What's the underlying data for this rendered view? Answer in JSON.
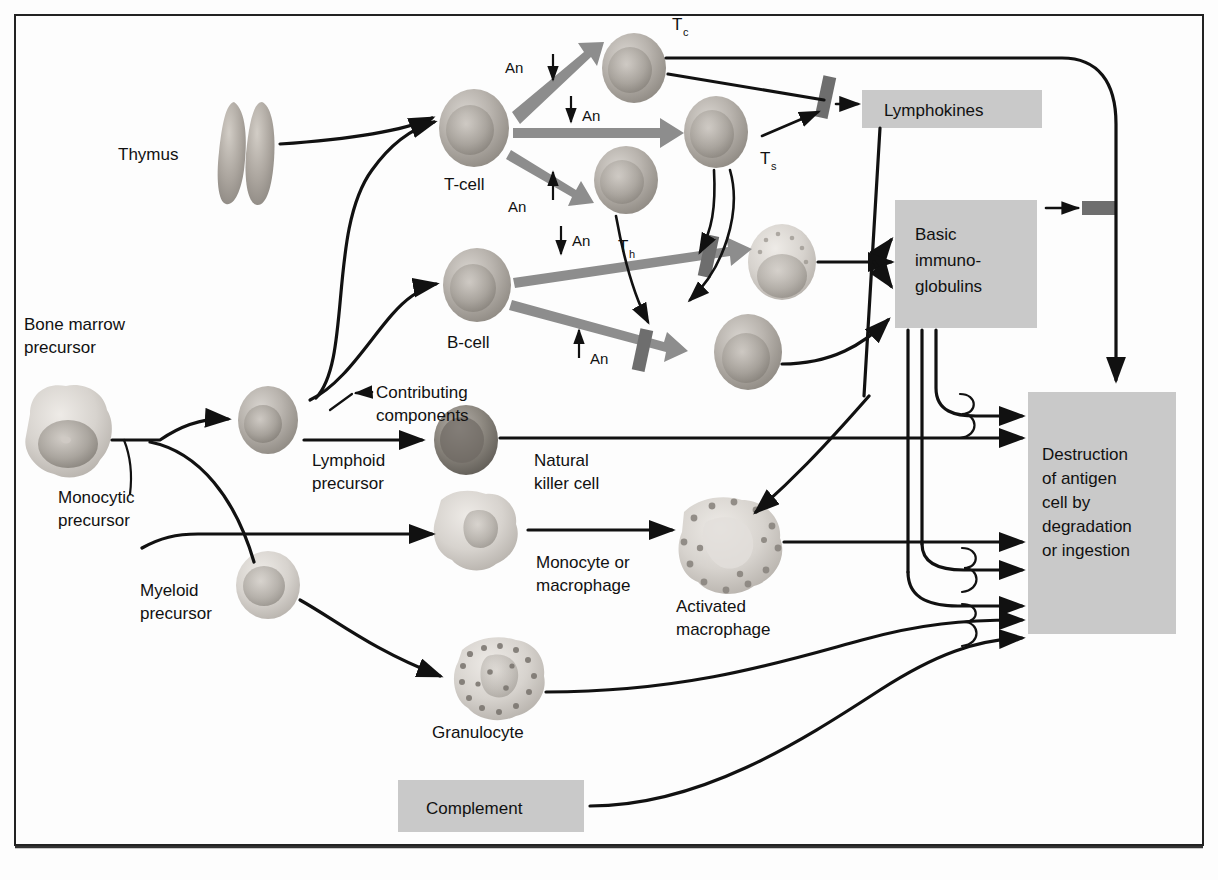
{
  "figure": {
    "domain": "biology-immunology-flow-diagram",
    "frame": {
      "x": 14,
      "y": 14,
      "width": 1190,
      "height": 832
    }
  },
  "colors": {
    "background": "#fdfdfd",
    "box_fill": "#c9c9c9",
    "fat_arrow": "#8d8d8d",
    "gate_bar": "#6e6e6e",
    "line": "#111111",
    "frame": "#222222"
  },
  "labels": {
    "thymus": "Thymus",
    "bone_marrow_precursor": "Bone marrow\nprecursor",
    "bone_marrow_precursor_line1": "Bone marrow",
    "bone_marrow_precursor_line2": "precursor",
    "monocytic_precursor_line1": "Monocytic",
    "monocytic_precursor_line2": "precursor",
    "myeloid_precursor_line1": "Myeloid",
    "myeloid_precursor_line2": "precursor",
    "lymphoid_precursor_line1": "Lymphoid",
    "lymphoid_precursor_line2": "precursor",
    "natural_killer_line1": "Natural",
    "natural_killer_line2": "killer cell",
    "monocyte_macrophage_line1": "Monocyte or",
    "monocyte_macrophage_line2": "macrophage",
    "activated_macrophage_line1": "Activated",
    "activated_macrophage_line2": "macrophage",
    "granulocyte": "Granulocyte",
    "t_cell": "T-cell",
    "b_cell": "B-cell",
    "contributing_components_line1": "Contributing",
    "contributing_components_line2": "components",
    "antigen_abbrev": "An",
    "t_cytotoxic_base": "T",
    "t_cytotoxic_sub": "c",
    "t_suppressor_base": "T",
    "t_suppressor_sub": "s",
    "t_helper_base": "T",
    "t_helper_sub": "h"
  },
  "boxes": [
    {
      "name": "lymphokines",
      "text": "Lymphokines",
      "lines": [
        "Lymphokines"
      ],
      "x": 862,
      "y": 90,
      "width": 180,
      "height": 38,
      "text_x": 884,
      "text_y": 116,
      "align": "left"
    },
    {
      "name": "basic-immunoglobulins",
      "text": "Basic immuno-globulins",
      "lines": [
        "Basic",
        "immuno-",
        "globulins"
      ],
      "x": 895,
      "y": 200,
      "width": 142,
      "height": 128,
      "text_x": 915,
      "text_y": 238,
      "align": "left"
    },
    {
      "name": "destruction-of-antigen",
      "text": "Destruction of antigen cell by degradation or ingestion",
      "lines": [
        "Destruction",
        "of antigen",
        "cell by",
        "degradation",
        "or ingestion"
      ],
      "x": 1028,
      "y": 392,
      "width": 148,
      "height": 242,
      "text_x": 1042,
      "text_y": 452,
      "align": "left"
    },
    {
      "name": "complement",
      "text": "Complement",
      "lines": [
        "Complement"
      ],
      "x": 398,
      "y": 780,
      "width": 186,
      "height": 52,
      "text_x": 426,
      "text_y": 812,
      "align": "left"
    }
  ],
  "antigen_markers": [
    {
      "name": "an-tcell-upper",
      "label": "An",
      "text_x": 505,
      "text_y": 73,
      "arrow_x": 553,
      "arrow_y1": 56,
      "arrow_y2": 82,
      "direction": "down"
    },
    {
      "name": "an-tcell-mid",
      "label": "An",
      "text_x": 590,
      "text_y": 121,
      "arrow_x": 571,
      "arrow_y1": 98,
      "arrow_y2": 124,
      "direction": "down"
    },
    {
      "name": "an-tcell-lower",
      "label": "An",
      "text_x": 508,
      "text_y": 200,
      "arrow_x": 553,
      "arrow_y1": 198,
      "arrow_y2": 168,
      "direction": "up"
    },
    {
      "name": "an-bcell-upper",
      "label": "An",
      "text_x": 580,
      "text_y": 246,
      "arrow_x": 561,
      "arrow_y1": 228,
      "arrow_y2": 256,
      "direction": "down"
    },
    {
      "name": "an-bcell-lower",
      "label": "An",
      "text_x": 598,
      "text_y": 356,
      "arrow_x": 579,
      "arrow_y1": 356,
      "arrow_y2": 328,
      "direction": "up"
    }
  ],
  "cells": [
    {
      "name": "cell-thymus",
      "kind": "thymus",
      "cx": 242,
      "cy": 152,
      "rx": 22,
      "ry": 52
    },
    {
      "name": "cell-bone-marrow-precursor",
      "kind": "blob",
      "cx": 62,
      "cy": 432,
      "rx": 45,
      "ry": 42
    },
    {
      "name": "cell-monocytic-lymphoid-precursor",
      "kind": "round",
      "cx": 268,
      "cy": 420,
      "rx": 30,
      "ry": 34
    },
    {
      "name": "cell-myeloid-precursor",
      "kind": "round-pale",
      "cx": 268,
      "cy": 585,
      "rx": 32,
      "ry": 34
    },
    {
      "name": "cell-natural-killer",
      "kind": "round-dark",
      "cx": 466,
      "cy": 440,
      "rx": 32,
      "ry": 35
    },
    {
      "name": "cell-monocyte-macrophage",
      "kind": "blob",
      "cx": 477,
      "cy": 530,
      "rx": 40,
      "ry": 38
    },
    {
      "name": "cell-granulocyte",
      "kind": "granular",
      "cx": 500,
      "cy": 678,
      "rx": 44,
      "ry": 40
    },
    {
      "name": "cell-activated-macrophage",
      "kind": "granular-big",
      "cx": 726,
      "cy": 545,
      "rx": 48,
      "ry": 45
    },
    {
      "name": "cell-t-cell",
      "kind": "round",
      "cx": 474,
      "cy": 128,
      "rx": 35,
      "ry": 39
    },
    {
      "name": "cell-t-cytotoxic",
      "kind": "round",
      "cx": 634,
      "cy": 68,
      "rx": 32,
      "ry": 35
    },
    {
      "name": "cell-t-suppressor",
      "kind": "round",
      "cx": 716,
      "cy": 132,
      "rx": 32,
      "ry": 36
    },
    {
      "name": "cell-t-helper",
      "kind": "round",
      "cx": 626,
      "cy": 180,
      "rx": 32,
      "ry": 34
    },
    {
      "name": "cell-b-cell",
      "kind": "round",
      "cx": 477,
      "cy": 285,
      "rx": 34,
      "ry": 37
    },
    {
      "name": "cell-plasma-upper",
      "kind": "granular-round",
      "cx": 782,
      "cy": 262,
      "rx": 34,
      "ry": 38
    },
    {
      "name": "cell-plasma-lower",
      "kind": "round",
      "cx": 748,
      "cy": 352,
      "rx": 34,
      "ry": 38
    }
  ],
  "gates": [
    {
      "name": "gate-lymphokines",
      "x": 819,
      "y": 76,
      "width": 13,
      "height": 40,
      "angle": 12
    },
    {
      "name": "gate-immunoglobulin-feedback",
      "x": 1082,
      "y": 200,
      "width": 34,
      "height": 14,
      "angle": 0
    },
    {
      "name": "gate-plasma-upper",
      "x": 702,
      "y": 238,
      "width": 13,
      "height": 40,
      "angle": 12
    },
    {
      "name": "gate-plasma-lower",
      "x": 636,
      "y": 328,
      "width": 13,
      "height": 40,
      "angle": 12
    }
  ],
  "flow_summary": {
    "description": "Hematopoietic and immune effector pathway",
    "stages": [
      "Bone marrow precursor",
      "Lymphoid / Myeloid precursors",
      "T-cell and B-cell activation by antigen",
      "Effector products",
      "Destruction of antigen"
    ]
  }
}
